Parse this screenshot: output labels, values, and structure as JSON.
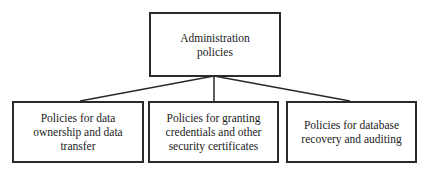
{
  "diagram": {
    "type": "hierarchy",
    "root": {
      "label": "Administration policies",
      "lines": [
        "Administration",
        "policies"
      ]
    },
    "children": [
      {
        "label": "Policies for data ownership and data transfer",
        "lines": [
          "Policies for data",
          "ownership and data",
          "transfer"
        ]
      },
      {
        "label": "Policies for granting credentials and other security certificates",
        "lines": [
          "Policies for granting",
          "credentials and other",
          "security certificates"
        ]
      },
      {
        "label": "Policies for database recovery and auditing",
        "lines": [
          "Policies for database",
          "recovery and auditing"
        ]
      }
    ],
    "colors": {
      "line": "#2a2a2a",
      "background": "#ffffff",
      "text": "#222222"
    }
  }
}
